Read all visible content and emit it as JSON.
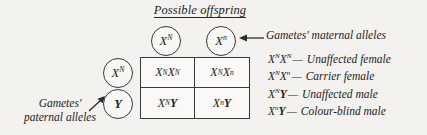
{
  "title": "Possible offspring",
  "maternal_label": "Gametes' maternal alleles",
  "paternal_label_line1": "Gametes'",
  "paternal_label_line2": "paternal alleles",
  "gametes": {
    "maternal": [
      {
        "base": "X",
        "sup": "N"
      },
      {
        "base": "X",
        "sup": "n"
      }
    ],
    "paternal": [
      {
        "base": "X",
        "sup": "N"
      },
      {
        "base": "Y",
        "sup": ""
      }
    ]
  },
  "punnett_cells": [
    {
      "a_base": "X",
      "a_sup": "N",
      "b_base": "X",
      "b_sup": "N"
    },
    {
      "a_base": "X",
      "a_sup": "N",
      "b_base": "X",
      "b_sup": "n"
    },
    {
      "a_base": "X",
      "a_sup": "N",
      "b_base": "Y",
      "b_sup": ""
    },
    {
      "a_base": "X",
      "a_sup": "n",
      "b_base": "Y",
      "b_sup": ""
    }
  ],
  "legend": [
    {
      "a_base": "X",
      "a_sup": "N",
      "b_base": "X",
      "b_sup": "N",
      "dash": "—",
      "phenotype": "Unaffected female"
    },
    {
      "a_base": "X",
      "a_sup": "N",
      "b_base": "X",
      "b_sup": "n",
      "dash": "—",
      "phenotype": "Carrier female"
    },
    {
      "a_base": "X",
      "a_sup": "N",
      "b_base": "Y",
      "b_sup": "",
      "dash": "—",
      "phenotype": "Unaffected male"
    },
    {
      "a_base": "X",
      "a_sup": "n",
      "b_base": "Y",
      "b_sup": "",
      "dash": "—",
      "phenotype": "Colour-blind male"
    }
  ],
  "colors": {
    "background": "#f4f2ef",
    "stroke": "#3a3a3a",
    "text": "#1c1c1c"
  }
}
